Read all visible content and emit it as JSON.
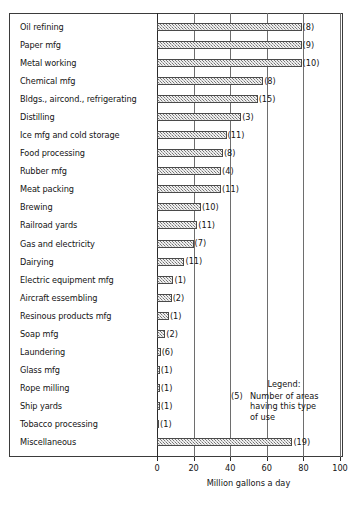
{
  "chart_data": {
    "type": "bar",
    "orientation": "horizontal",
    "title": "",
    "xlabel": "Million gallons a day",
    "ylabel": "",
    "xlim": [
      0,
      100
    ],
    "xticks": [
      0,
      20,
      40,
      60,
      80,
      100
    ],
    "grid": true,
    "legend_position": "inside-lower-right",
    "categories": [
      "Oil refining",
      "Paper mfg",
      "Metal working",
      "Chemical mfg",
      "Bldgs., aircond., refrigerating",
      "Distilling",
      "Ice mfg and cold storage",
      "Food processing",
      "Rubber mfg",
      "Meat packing",
      "Brewing",
      "Railroad yards",
      "Gas and electricity",
      "Dairying",
      "Electric equipment mfg",
      "Aircraft essembling",
      "Resinous products mfg",
      "Soap mfg",
      "Laundering",
      "Glass mfg",
      "Rope milling",
      "Ship yards",
      "Tobacco processing",
      "Miscellaneous"
    ],
    "values": [
      79,
      79,
      79,
      58,
      55,
      46,
      38,
      36,
      35,
      35,
      24,
      22,
      20,
      15,
      9,
      8,
      6.5,
      4.5,
      2,
      1.5,
      1.5,
      1.5,
      1,
      74
    ],
    "point_labels": [
      "(8)",
      "(9)",
      "(10)",
      "(8)",
      "(15)",
      "(3)",
      "(11)",
      "(8)",
      "(4)",
      "(11)",
      "(10)",
      "(11)",
      "(7)",
      "(11)",
      "(1)",
      "(2)",
      "(1)",
      "(2)",
      "(6)",
      "(1)",
      "(1)",
      "(1)",
      "(1)",
      "(19)"
    ],
    "series": [
      {
        "name": "Million gallons a day",
        "values": [
          79,
          79,
          79,
          58,
          55,
          46,
          38,
          36,
          35,
          35,
          24,
          22,
          20,
          15,
          9,
          8,
          6.5,
          4.5,
          2,
          1.5,
          1.5,
          1.5,
          1,
          74
        ]
      }
    ],
    "annotations": {
      "legend_title": "Legend:",
      "legend_key": "(5)",
      "legend_text": "Number of areas having this type of use"
    },
    "colors": {
      "bar_fill": "#b5b5b5",
      "bar_border": "#4a4a4a",
      "grid": "#6e6e6e",
      "axis": "#2b2b2b",
      "text": "#141414",
      "background": "#ffffff"
    }
  },
  "axis": {
    "tick_labels": [
      "0",
      "20",
      "40",
      "60",
      "80",
      "100"
    ],
    "title": "Million gallons a day"
  },
  "legend": {
    "title": "Legend:",
    "key": "(5)",
    "line1": "Number of areas",
    "line2": "having this type",
    "line3": "of use"
  }
}
